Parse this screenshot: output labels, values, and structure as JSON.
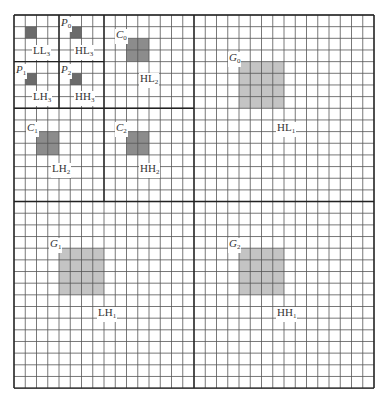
{
  "figure": {
    "grid": {
      "columns": 32,
      "rows": 32,
      "line_color": "#555555",
      "thick_line_color": "#222222"
    },
    "colors": {
      "level3_box": "#6b6b6b",
      "level2_box": "#8c8c8c",
      "level1_box": "#c4c4c4"
    },
    "regions": [
      {
        "id": "LL3",
        "label": "LL",
        "sub": "3",
        "box": {
          "col": 1,
          "row": 1,
          "w": 1,
          "h": 1,
          "level": 3
        },
        "marker": null,
        "label_pos": {
          "x": 32,
          "y": 45
        }
      },
      {
        "id": "HL3",
        "label": "HL",
        "sub": "3",
        "box": {
          "col": 5,
          "row": 1,
          "w": 1,
          "h": 1,
          "level": 3
        },
        "marker": {
          "name": "P",
          "sub": "0",
          "x": 60,
          "y": 17
        },
        "label_pos": {
          "x": 74,
          "y": 45
        }
      },
      {
        "id": "LH3",
        "label": "LH",
        "sub": "3",
        "box": {
          "col": 1,
          "row": 5,
          "w": 1,
          "h": 1,
          "level": 3
        },
        "marker": {
          "name": "P",
          "sub": "1",
          "x": 15,
          "y": 64
        },
        "label_pos": {
          "x": 32,
          "y": 91
        }
      },
      {
        "id": "HH3",
        "label": "HH",
        "sub": "3",
        "box": {
          "col": 5,
          "row": 5,
          "w": 1,
          "h": 1,
          "level": 3
        },
        "marker": {
          "name": "P",
          "sub": "2",
          "x": 60,
          "y": 64
        },
        "label_pos": {
          "x": 74,
          "y": 91
        }
      },
      {
        "id": "HL2",
        "label": "HL",
        "sub": "2",
        "box": {
          "col": 10,
          "row": 2,
          "w": 2,
          "h": 2,
          "level": 2
        },
        "marker": {
          "name": "C",
          "sub": "0",
          "x": 115,
          "y": 29
        },
        "label_pos": {
          "x": 139,
          "y": 73
        }
      },
      {
        "id": "LH2",
        "label": "LH",
        "sub": "2",
        "box": {
          "col": 2,
          "row": 10,
          "w": 2,
          "h": 2,
          "level": 2
        },
        "marker": {
          "name": "C",
          "sub": "1",
          "x": 26,
          "y": 122
        },
        "label_pos": {
          "x": 51,
          "y": 163
        }
      },
      {
        "id": "HH2",
        "label": "HH",
        "sub": "2",
        "box": {
          "col": 10,
          "row": 10,
          "w": 2,
          "h": 2,
          "level": 2
        },
        "marker": {
          "name": "C",
          "sub": "2",
          "x": 115,
          "y": 122
        },
        "label_pos": {
          "x": 139,
          "y": 163
        }
      },
      {
        "id": "HL1",
        "label": "HL",
        "sub": "1",
        "box": {
          "col": 20,
          "row": 4,
          "w": 4,
          "h": 4,
          "level": 1
        },
        "marker": {
          "name": "G",
          "sub": "0",
          "x": 228,
          "y": 52
        },
        "label_pos": {
          "x": 276,
          "y": 122
        }
      },
      {
        "id": "LH1",
        "label": "LH",
        "sub": "1",
        "box": {
          "col": 4,
          "row": 20,
          "w": 4,
          "h": 4,
          "level": 1
        },
        "marker": {
          "name": "G",
          "sub": "1",
          "x": 49,
          "y": 238
        },
        "label_pos": {
          "x": 97,
          "y": 307
        }
      },
      {
        "id": "HH1",
        "label": "HH",
        "sub": "1",
        "box": {
          "col": 20,
          "row": 20,
          "w": 4,
          "h": 4,
          "level": 1
        },
        "marker": {
          "name": "G",
          "sub": "2",
          "x": 228,
          "y": 238
        },
        "label_pos": {
          "x": 276,
          "y": 307
        }
      }
    ]
  }
}
